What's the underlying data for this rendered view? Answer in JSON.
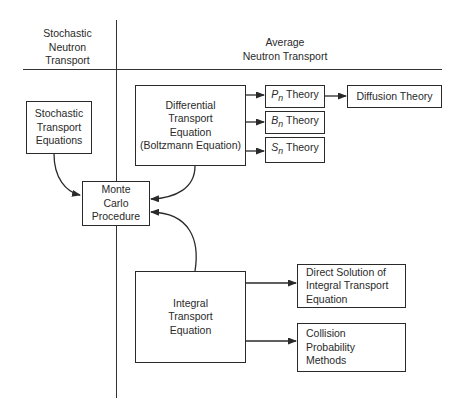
{
  "headers": {
    "left": "Stochastic\nNeutron\nTransport",
    "right": "Average\nNeutron Transport"
  },
  "nodes": {
    "stochastic_transport_equations": "Stochastic\nTransport\nEquations",
    "differential_transport_equation": "Differential\nTransport\nEquation\n(Boltzmann Equation)",
    "pn_theory": {
      "symbol": "P",
      "subscript": "n",
      "label": " Theory"
    },
    "bn_theory": {
      "symbol": "B",
      "subscript": "n",
      "label": " Theory"
    },
    "sn_theory": {
      "symbol": "S",
      "subscript": "n",
      "label": " Theory"
    },
    "diffusion_theory": "Diffusion Theory",
    "monte_carlo_procedure": "Monte\nCarlo\nProcedure",
    "integral_transport_equation": "Integral\nTransport\nEquation",
    "direct_solution": "Direct Solution of\nIntegral Transport\nEquation",
    "collision_probability_methods": "Collision\nProbability\nMethods"
  },
  "edges": [
    {
      "from": "differential_transport_equation",
      "to": "pn_theory"
    },
    {
      "from": "differential_transport_equation",
      "to": "bn_theory"
    },
    {
      "from": "differential_transport_equation",
      "to": "sn_theory"
    },
    {
      "from": "pn_theory",
      "to": "diffusion_theory"
    },
    {
      "from": "stochastic_transport_equations",
      "to": "monte_carlo_procedure"
    },
    {
      "from": "differential_transport_equation",
      "to": "monte_carlo_procedure"
    },
    {
      "from": "integral_transport_equation",
      "to": "monte_carlo_procedure"
    },
    {
      "from": "integral_transport_equation",
      "to": "direct_solution"
    },
    {
      "from": "integral_transport_equation",
      "to": "collision_probability_methods"
    }
  ]
}
